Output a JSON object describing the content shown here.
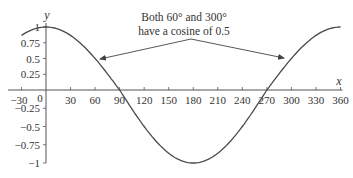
{
  "chart_data": {
    "type": "line",
    "title": "",
    "function": "cos(x)",
    "xlabel": "x",
    "ylabel": "y",
    "xlim": [
      -30,
      360
    ],
    "ylim": [
      -1,
      1
    ],
    "grid": false,
    "legend": null,
    "x_ticks": [
      -30,
      0,
      30,
      60,
      90,
      120,
      150,
      180,
      210,
      240,
      270,
      300,
      330,
      360
    ],
    "x_tick_labels": [
      "-30",
      "0",
      "30",
      "60",
      "90",
      "120",
      "150",
      "180",
      "210",
      "240",
      "270",
      "300",
      "330",
      "360"
    ],
    "y_ticks": [
      1,
      0.75,
      0.5,
      0.25,
      -0.25,
      -0.5,
      -0.75,
      -1
    ],
    "y_tick_labels": [
      "1",
      "0.75",
      "0.5",
      "0.25",
      "-0.25",
      "-0.5",
      "-0.75",
      "-1"
    ],
    "series": [
      {
        "name": "cos x",
        "x": [
          -30,
          0,
          30,
          60,
          90,
          120,
          150,
          180,
          210,
          240,
          270,
          300,
          330,
          360
        ],
        "values": [
          0.866,
          1,
          0.866,
          0.5,
          0,
          -0.5,
          -0.866,
          -1,
          -0.866,
          -0.5,
          0,
          0.5,
          0.866,
          1
        ]
      }
    ],
    "annotations": [
      {
        "text_line1": "Both 60° and 300°",
        "text_line2": "have a cosine of 0.5",
        "points_to": [
          [
            60,
            0.5
          ],
          [
            300,
            0.5
          ]
        ]
      }
    ]
  },
  "colors": {
    "curve": "#4a4a4a",
    "axis": "#555555",
    "text": "#333333"
  }
}
